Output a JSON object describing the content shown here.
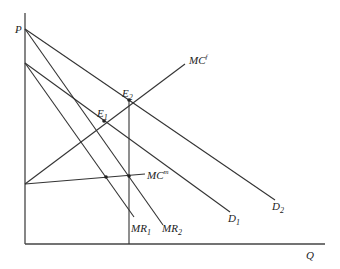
{
  "diagram": {
    "type": "economics-supply-demand",
    "axes": {
      "y_label": "P",
      "x_label": "Q"
    },
    "curves": [
      {
        "id": "D2",
        "label": "D",
        "subscript": "2",
        "kind": "demand"
      },
      {
        "id": "D1",
        "label": "D",
        "subscript": "1",
        "kind": "demand"
      },
      {
        "id": "MR2",
        "label": "MR",
        "subscript": "2",
        "kind": "marginal-revenue"
      },
      {
        "id": "MR1",
        "label": "MR",
        "subscript": "1",
        "kind": "marginal-revenue"
      },
      {
        "id": "MCf",
        "label": "MC",
        "superscript": "f",
        "kind": "marginal-cost"
      },
      {
        "id": "MCm",
        "label": "MC",
        "superscript": "m",
        "kind": "marginal-cost"
      }
    ],
    "points": [
      {
        "id": "E1",
        "label": "E",
        "subscript": "1"
      },
      {
        "id": "E2",
        "label": "E",
        "subscript": "2"
      }
    ]
  }
}
